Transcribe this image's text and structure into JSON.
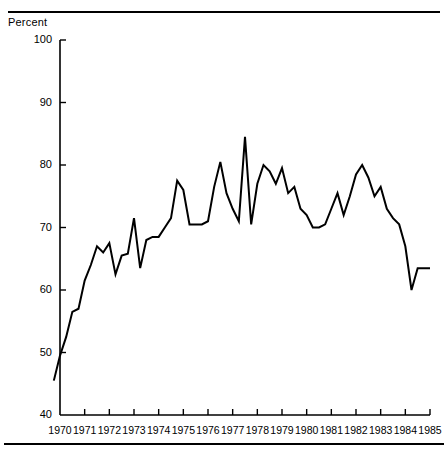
{
  "axis": {
    "y_label": "Percent",
    "y_ticks": [
      100,
      90,
      80,
      70,
      60,
      50,
      40
    ],
    "x_ticks": [
      "1970",
      "1971",
      "1972",
      "1973",
      "1974",
      "1975",
      "1976",
      "1977",
      "1978",
      "1979",
      "1980",
      "1981",
      "1982",
      "1983",
      "1984",
      "1985"
    ]
  },
  "chart_data": {
    "type": "line",
    "title": "",
    "xlabel": "",
    "ylabel": "Percent",
    "ylim": [
      40,
      100
    ],
    "xlim": [
      1969.75,
      1985.0
    ],
    "grid": false,
    "legend": null,
    "series": [
      {
        "name": "Percent",
        "x": [
          1969.75,
          1970.0,
          1970.25,
          1970.5,
          1970.75,
          1971.0,
          1971.25,
          1971.5,
          1971.75,
          1972.0,
          1972.25,
          1972.5,
          1972.75,
          1973.0,
          1973.25,
          1973.5,
          1973.75,
          1974.0,
          1974.25,
          1974.5,
          1974.75,
          1975.0,
          1975.25,
          1975.5,
          1975.75,
          1976.0,
          1976.25,
          1976.5,
          1976.75,
          1977.0,
          1977.25,
          1977.5,
          1977.75,
          1978.0,
          1978.25,
          1978.5,
          1978.75,
          1979.0,
          1979.25,
          1979.5,
          1979.75,
          1980.0,
          1980.25,
          1980.5,
          1980.75,
          1981.0,
          1981.25,
          1981.5,
          1981.75,
          1982.0,
          1982.25,
          1982.5,
          1982.75,
          1983.0,
          1983.25,
          1983.5,
          1983.75,
          1984.0,
          1984.25,
          1984.5,
          1984.75,
          1985.0
        ],
        "y": [
          45.5,
          49.5,
          52.5,
          56.5,
          57.0,
          61.5,
          64.0,
          67.0,
          66.0,
          67.5,
          62.5,
          65.5,
          65.8,
          71.5,
          63.5,
          68.0,
          68.5,
          68.5,
          70.0,
          71.5,
          77.5,
          76.0,
          70.5,
          70.5,
          70.5,
          71.0,
          76.5,
          80.5,
          75.5,
          73.0,
          71.0,
          84.5,
          70.5,
          77.0,
          80.0,
          79.0,
          77.0,
          79.5,
          75.5,
          76.5,
          73.0,
          72.0,
          70.0,
          70.0,
          70.5,
          73.0,
          75.5,
          72.0,
          75.0,
          78.5,
          80.0,
          78.0,
          75.0,
          76.5,
          73.0,
          71.5,
          70.5,
          67.0,
          60.0,
          63.5,
          63.5,
          63.5
        ],
        "color": "#000000"
      }
    ]
  }
}
